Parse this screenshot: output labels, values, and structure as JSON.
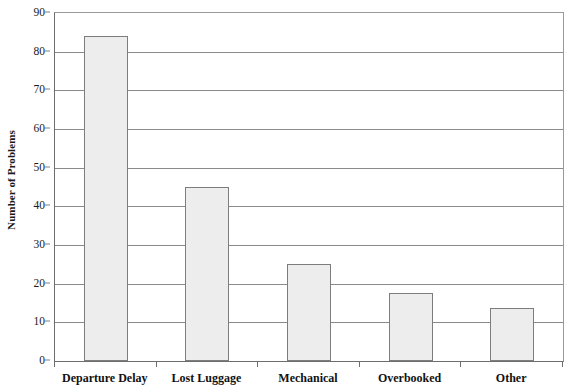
{
  "chart_data": {
    "type": "bar",
    "title": "",
    "subtitle": "",
    "xlabel": "",
    "ylabel": "Number of Problems",
    "categories": [
      "Departure Delay",
      "Lost Luggage",
      "Mechanical",
      "Overbooked",
      "Other"
    ],
    "values": [
      84,
      45,
      25,
      17.5,
      13.7
    ],
    "series": [
      {
        "name": "Number of Problems",
        "values": [
          84,
          45,
          25,
          17.5,
          13.7
        ]
      }
    ],
    "ylim": [
      0,
      90
    ],
    "y_ticks": [
      0,
      10,
      20,
      30,
      40,
      50,
      60,
      70,
      80,
      90
    ],
    "y_tick_labels": [
      "0",
      "10",
      "20",
      "30",
      "40",
      "50",
      "60",
      "70",
      "80",
      "90"
    ],
    "grid": true,
    "grid_axis": "y",
    "legend": false,
    "legend_position": "none",
    "annotations": [],
    "colors": {
      "bar_fill": "#ededed",
      "bar_border": "#7d7d7d",
      "gridline": "#8a8a8a",
      "axis": "#6e6e6e",
      "text": "#111111",
      "background": "#ffffff"
    }
  }
}
